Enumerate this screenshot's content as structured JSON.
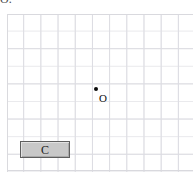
{
  "caption": {
    "text": "O."
  },
  "canvas": {
    "name": "graph-grid-canvas",
    "background_color": "#ffffff",
    "grid_minor_color": "#e9e9ec",
    "grid_major_color": "#dcdce2",
    "border_color": "#d9d9de",
    "width": 186,
    "height": 158,
    "grid_minor_step_x": 17.2,
    "grid_minor_step_y": 17.6,
    "grid_major_step_x": 17.2,
    "grid_major_step_y": 35.2
  },
  "points": [
    {
      "label": "O",
      "color": "#0a0a0a",
      "x": 96,
      "y": 89,
      "label_x": 99,
      "label_y": 93
    }
  ],
  "buttons": [
    {
      "label": "C",
      "name": "button-c",
      "x": 20,
      "y": 141,
      "width": 50,
      "height": 17,
      "fill_color": "#c8c8c8",
      "border_color": "#5e5e5e",
      "text_color": "#1a1a1a"
    }
  ]
}
